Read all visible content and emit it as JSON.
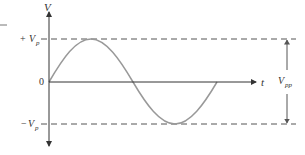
{
  "diagram": {
    "colors": {
      "axis": "#333333",
      "wave": "#999999",
      "dashed": "#555555",
      "text": "#333333"
    },
    "axes": {
      "y_label": "V",
      "x_label": "t"
    },
    "levels": {
      "positive_peak": {
        "sign": "+",
        "symbol": "V",
        "subscript": "p"
      },
      "zero": "0",
      "negative_peak": {
        "sign": "−",
        "symbol": "V",
        "subscript": "p"
      }
    },
    "peak_to_peak": {
      "symbol": "V",
      "subscript": "pp"
    }
  }
}
